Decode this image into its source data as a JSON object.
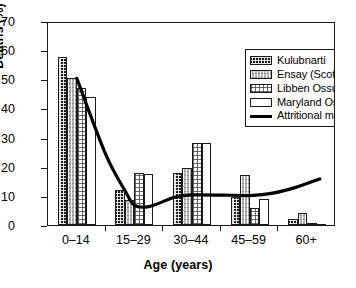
{
  "chart_data": {
    "type": "bar",
    "title": "",
    "xlabel": "Age (years)",
    "ylabel": "Deaths (%)",
    "categories": [
      "0–14",
      "15–29",
      "30–44",
      "45–59",
      "60+"
    ],
    "ylim": [
      0,
      70
    ],
    "yticks": [
      0,
      10,
      20,
      30,
      40,
      50,
      60,
      70
    ],
    "grid": false,
    "legend_position": "top-right",
    "series": [
      {
        "name": "Kulubnarti",
        "fill": "dark-checkered",
        "values": [
          57.5,
          12.0,
          18.0,
          9.5,
          2.0
        ]
      },
      {
        "name": "Ensay (Scotland)",
        "fill": "gray-hatched",
        "values": [
          50.5,
          8.5,
          19.5,
          17.0,
          4.0
        ]
      },
      {
        "name": "Libben Ossuary",
        "fill": "white-dotted",
        "values": [
          47.0,
          18.0,
          28.0,
          6.0,
          0.5
        ]
      },
      {
        "name": "Maryland Ossuaries",
        "fill": "white-plain",
        "values": [
          44.0,
          17.5,
          28.0,
          9.0,
          0.2
        ]
      }
    ],
    "line_series": {
      "name": "Attritional model e₀ = 25",
      "label_prefix": "Attritional model e",
      "label_subscript": "0",
      "label_suffix": " = 25",
      "color": "#000000",
      "x": [
        "0–14",
        "15–29",
        "30–44",
        "45–59",
        "60+"
      ],
      "values": [
        51.0,
        7.5,
        11.0,
        10.8,
        16.5
      ],
      "min_value": 7.0
    }
  },
  "axes": {
    "y_title": "Deaths (%)",
    "x_title": "Age (years)",
    "y_tick_labels": [
      "70",
      "60",
      "50",
      "40",
      "30",
      "20",
      "10",
      "0"
    ],
    "x_tick_labels": [
      "0–14",
      "15–29",
      "30–44",
      "45–59",
      "60+"
    ]
  },
  "legend": {
    "items": [
      {
        "label": "Kulubnarti",
        "swatch": "dark-checkered-swatch"
      },
      {
        "label": "Ensay (Scotland)",
        "swatch": "gray-hatched-swatch"
      },
      {
        "label": "Libben Ossuary",
        "swatch": "white-dotted-swatch"
      },
      {
        "label": "Maryland Ossuaries",
        "swatch": "white-plain-swatch"
      }
    ],
    "line_item": {
      "prefix": "Attritional model e",
      "subscript": "0",
      "suffix": " = 25",
      "swatch": "black-line-swatch"
    }
  }
}
